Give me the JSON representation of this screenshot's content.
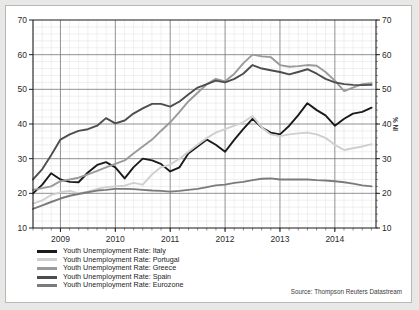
{
  "source_note": "Source: Thompson Reuters Datastream",
  "legend": {
    "items": [
      {
        "label": "Youth Unemployment Rate: Italy",
        "color": "#1a1a1a"
      },
      {
        "label": "Youth Unemployment Rate: Portugal",
        "color": "#cfcfcf"
      },
      {
        "label": "Youth Unemployment Rate: Greece",
        "color": "#9a9a9a"
      },
      {
        "label": "Youth Unemployment Rate: Spain",
        "color": "#4d4d4d"
      },
      {
        "label": "Youth Unemployment Rate: Eurozone",
        "color": "#7b7b7b"
      }
    ]
  },
  "chart_data": {
    "type": "line",
    "title": "",
    "xlabel": "",
    "ylabel": "IN %",
    "ylabel_right": "IN %",
    "xlim": [
      2008.5,
      2014.75
    ],
    "ylim": [
      10,
      70
    ],
    "yticks": [
      10,
      20,
      30,
      40,
      50,
      60,
      70
    ],
    "ytick_labels": [
      "10",
      "20",
      "30",
      "40",
      "50",
      "60",
      "70"
    ],
    "xticks": [
      2009,
      2010,
      2011,
      2012,
      2013,
      2014
    ],
    "xtick_labels": [
      "2009",
      "2010",
      "2011",
      "2012",
      "2013",
      "2014"
    ],
    "grid": true,
    "minor_grid": true,
    "legend_position": "below-left",
    "x": [
      2008.5,
      2008.67,
      2008.83,
      2009.0,
      2009.17,
      2009.33,
      2009.5,
      2009.67,
      2009.83,
      2010.0,
      2010.17,
      2010.33,
      2010.5,
      2010.67,
      2010.83,
      2011.0,
      2011.17,
      2011.33,
      2011.5,
      2011.67,
      2011.83,
      2012.0,
      2012.17,
      2012.33,
      2012.5,
      2012.67,
      2012.83,
      2013.0,
      2013.17,
      2013.33,
      2013.5,
      2013.67,
      2013.83,
      2014.0,
      2014.17,
      2014.33,
      2014.5,
      2014.67
    ],
    "series": [
      {
        "name": "Youth Unemployment Rate: Italy",
        "color": "#1a1a1a",
        "values": [
          20.0,
          22.5,
          25.8,
          24.0,
          23.3,
          23.2,
          26.0,
          28.2,
          29.0,
          27.5,
          24.3,
          27.5,
          30.0,
          29.5,
          28.5,
          26.3,
          27.5,
          31.5,
          33.5,
          35.5,
          34.0,
          32.0,
          35.5,
          38.5,
          41.5,
          39.0,
          37.5,
          37.0,
          39.5,
          42.5,
          46.0,
          44.0,
          42.5,
          39.5,
          41.5,
          43.0,
          43.5,
          44.7
        ]
      },
      {
        "name": "Youth Unemployment Rate: Portugal",
        "color": "#cfcfcf",
        "values": [
          17.0,
          18.0,
          19.5,
          20.3,
          20.7,
          20.0,
          20.5,
          21.3,
          21.8,
          22.0,
          22.2,
          23.0,
          22.5,
          25.5,
          27.5,
          28.3,
          30.0,
          32.0,
          34.0,
          36.0,
          37.5,
          38.5,
          39.5,
          40.5,
          42.3,
          39.0,
          37.0,
          36.5,
          37.0,
          37.3,
          37.5,
          37.0,
          36.0,
          34.0,
          32.5,
          33.0,
          33.5,
          34.2
        ]
      },
      {
        "name": "Youth Unemployment Rate: Greece",
        "color": "#9a9a9a",
        "values": [
          21.0,
          21.5,
          22.0,
          23.5,
          24.0,
          24.5,
          25.5,
          26.5,
          27.5,
          28.5,
          29.5,
          31.5,
          33.5,
          35.5,
          38.0,
          40.5,
          43.5,
          46.5,
          49.0,
          51.5,
          53.0,
          52.3,
          54.5,
          57.5,
          60.0,
          59.5,
          59.3,
          57.0,
          56.5,
          56.7,
          57.0,
          56.8,
          55.0,
          52.5,
          49.5,
          50.5,
          51.5,
          51.8
        ]
      },
      {
        "name": "Youth Unemployment Rate: Spain",
        "color": "#4d4d4d",
        "values": [
          24.0,
          27.0,
          31.0,
          35.5,
          37.0,
          38.0,
          38.5,
          39.5,
          41.7,
          40.2,
          41.0,
          43.0,
          44.5,
          45.8,
          45.8,
          45.0,
          46.5,
          48.5,
          50.5,
          51.5,
          52.5,
          52.0,
          53.0,
          54.5,
          57.0,
          56.0,
          55.5,
          55.0,
          54.3,
          55.0,
          55.8,
          54.5,
          53.0,
          52.0,
          51.5,
          51.3,
          51.2,
          51.3
        ]
      },
      {
        "name": "Youth Unemployment Rate: Eurozone",
        "color": "#7b7b7b",
        "values": [
          15.5,
          16.5,
          17.5,
          18.5,
          19.3,
          19.8,
          20.3,
          20.8,
          21.0,
          21.3,
          21.3,
          21.2,
          21.0,
          20.8,
          20.7,
          20.5,
          20.7,
          21.0,
          21.3,
          21.8,
          22.3,
          22.5,
          23.0,
          23.3,
          23.8,
          24.2,
          24.3,
          24.0,
          24.0,
          24.0,
          24.0,
          23.8,
          23.7,
          23.5,
          23.2,
          22.8,
          22.3,
          22.0
        ]
      }
    ]
  }
}
